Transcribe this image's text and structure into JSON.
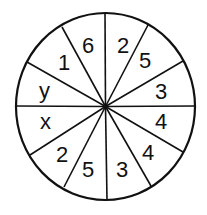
{
  "diagram": {
    "type": "spinner-wheel",
    "sector_count": 12,
    "colors": {
      "stroke": "#111111",
      "fill": "#ffffff",
      "text": "#111111"
    },
    "sectors": [
      {
        "position": "top-right-1",
        "label": "2"
      },
      {
        "position": "top-right-2",
        "label": "5"
      },
      {
        "position": "right-upper",
        "label": "3"
      },
      {
        "position": "right-lower",
        "label": "4"
      },
      {
        "position": "bottom-right-2",
        "label": "4"
      },
      {
        "position": "bottom-right-1",
        "label": "3"
      },
      {
        "position": "bottom-left-1",
        "label": "5"
      },
      {
        "position": "bottom-left-2",
        "label": "2"
      },
      {
        "position": "left-lower",
        "label": "x"
      },
      {
        "position": "left-upper",
        "label": "y"
      },
      {
        "position": "top-left-2",
        "label": "1"
      },
      {
        "position": "top-left-1",
        "label": "6"
      }
    ]
  }
}
